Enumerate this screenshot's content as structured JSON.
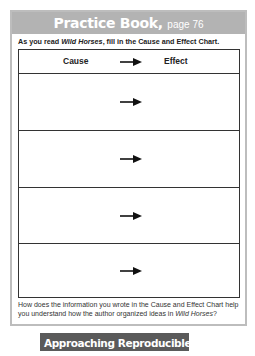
{
  "header": {
    "title": "Practice Book,",
    "page": "page 76",
    "band_color": "#b3b3b3"
  },
  "instruction": {
    "prefix": "As you read ",
    "book_title": "Wild Horses",
    "suffix": ", fill in the Cause and Effect Chart."
  },
  "chart": {
    "columns": [
      {
        "label": "Cause"
      },
      {
        "label": "Effect"
      }
    ],
    "arrow_icon": "right-arrow-icon",
    "rows": [
      {
        "cause": "",
        "effect": ""
      },
      {
        "cause": "",
        "effect": ""
      },
      {
        "cause": "",
        "effect": ""
      },
      {
        "cause": "",
        "effect": ""
      }
    ]
  },
  "question": {
    "prefix": "How does the information you wrote in the Cause and Effect Chart help you understand how the author organized ideas in ",
    "book_title": "Wild Horses",
    "suffix": "?"
  },
  "footer": {
    "title": "Approaching Reproducible,",
    "page": "page 76",
    "badge_color": "#5a5a5a"
  }
}
